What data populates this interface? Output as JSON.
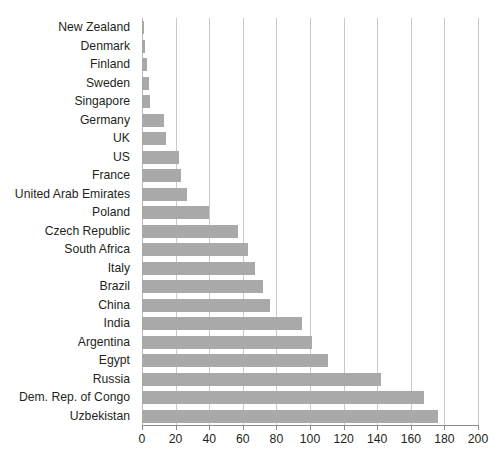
{
  "chart_data": {
    "type": "bar",
    "orientation": "horizontal",
    "title": "",
    "subtitle": "",
    "xlabel": "",
    "ylabel": "",
    "xlim": [
      0,
      200
    ],
    "ylim": null,
    "grid": true,
    "legend": null,
    "legend_position": "none",
    "bar_color": "#a9a9a9",
    "gridline_color": "#c9c9c9",
    "axis_color": "#8c8c8c",
    "text_color": "#231f20",
    "xticks": [
      0,
      20,
      40,
      60,
      80,
      100,
      120,
      140,
      160,
      180,
      200
    ],
    "xtick_labels": [
      "0",
      "20",
      "40",
      "60",
      "80",
      "100",
      "120",
      "140",
      "160",
      "180",
      "200"
    ],
    "categories": [
      "New Zealand",
      "Denmark",
      "Finland",
      "Sweden",
      "Singapore",
      "Germany",
      "UK",
      "US",
      "France",
      "United Arab Emirates",
      "Poland",
      "Czech Republic",
      "South Africa",
      "Italy",
      "Brazil",
      "China",
      "India",
      "Argentina",
      "Egypt",
      "Russia",
      "Dem. Rep. of Congo",
      "Uzbekistan"
    ],
    "values": [
      1,
      2,
      3,
      4,
      5,
      13,
      14,
      22,
      23,
      27,
      40,
      57,
      63,
      67,
      72,
      76,
      95,
      101,
      111,
      142,
      168,
      176
    ]
  }
}
